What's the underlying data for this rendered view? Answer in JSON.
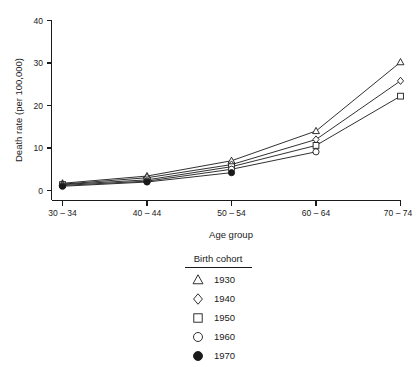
{
  "chart_data": {
    "type": "line",
    "title": "",
    "xlabel": "Age group",
    "ylabel": "Death rate (per 100,000)",
    "categories": [
      "30 – 34",
      "40 – 44",
      "50 – 54",
      "60 – 64",
      "70 – 74"
    ],
    "x_tick_labels": [
      "30 – 34",
      "40 – 44",
      "50 – 54",
      "60 – 64",
      "70 – 74"
    ],
    "y_tick_labels": [
      "0",
      "10",
      "20",
      "30",
      "40"
    ],
    "y_ticks": [
      0,
      10,
      20,
      30,
      40
    ],
    "ylim": [
      0,
      42
    ],
    "grid": false,
    "legend_position": "below-plot-center",
    "legend_title": "Birth cohort",
    "series": [
      {
        "name": "1930",
        "marker": "triangle",
        "filled": false,
        "values": [
          1.7,
          3.4,
          7.0,
          14.0,
          30.2
        ]
      },
      {
        "name": "1940",
        "marker": "diamond",
        "filled": false,
        "values": [
          1.5,
          3.0,
          6.1,
          12.0,
          25.8
        ]
      },
      {
        "name": "1950",
        "marker": "square",
        "filled": false,
        "values": [
          1.4,
          2.5,
          5.6,
          10.6,
          22.2
        ]
      },
      {
        "name": "1960",
        "marker": "circle",
        "filled": false,
        "values": [
          1.2,
          2.2,
          5.0,
          9.1,
          null
        ]
      },
      {
        "name": "1970",
        "marker": "circle",
        "filled": true,
        "values": [
          1.0,
          2.0,
          4.2,
          null,
          null
        ]
      }
    ]
  },
  "legend": {
    "title": "Birth cohort",
    "entries": [
      {
        "label": "1930",
        "marker": "triangle-up-open-icon"
      },
      {
        "label": "1940",
        "marker": "diamond-open-icon"
      },
      {
        "label": "1950",
        "marker": "square-open-icon"
      },
      {
        "label": "1960",
        "marker": "circle-open-icon"
      },
      {
        "label": "1970",
        "marker": "circle-filled-icon"
      }
    ]
  },
  "colors": {
    "ink": "#1a1a1a",
    "background": "#ffffff",
    "marker_fill": "#ffffff"
  }
}
